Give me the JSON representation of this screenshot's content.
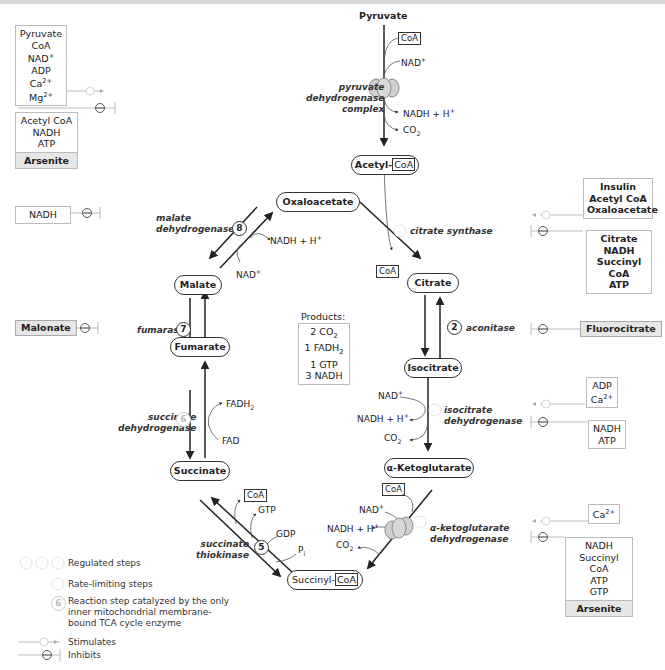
{
  "diagram": {
    "metabolites": {
      "pyruvate": "Pyruvate",
      "acetyl_coa_prefix": "Acetyl-",
      "coa": "CoA",
      "oxaloacetate": "Oxaloacetate",
      "citrate": "Citrate",
      "isocitrate": "Isocitrate",
      "alpha_ketoglutarate": "α-Ketoglutarate",
      "succinyl_coa_prefix": "Succinyl-",
      "succinate": "Succinate",
      "fumarate": "Fumarate",
      "malate": "Malate"
    },
    "enzymes": {
      "pdh": [
        "pyruvate",
        "dehydrogenase",
        "complex"
      ],
      "citrate_synthase": "citrate synthase",
      "aconitase": "aconitase",
      "isocitrate_dh": [
        "isocitrate",
        "dehydrogenase"
      ],
      "akg_dh": [
        "α-ketoglutarate",
        "dehydrogenase"
      ],
      "succinate_thiokinase": [
        "succinate",
        "thiokinase"
      ],
      "succinate_dh": [
        "succinate",
        "dehydrogenase"
      ],
      "fumarase": "fumarase",
      "malate_dh": [
        "malate",
        "dehydrogenase"
      ]
    },
    "step_numbers": {
      "s1": "1",
      "s2": "2",
      "s3": "3",
      "s4": "4",
      "s5": "5",
      "s6": "6",
      "s7": "7",
      "s8": "8"
    },
    "cofactors": {
      "coa": "CoA",
      "nad": "NAD+",
      "nadh": "NADH + H+",
      "co2": "CO2",
      "fad": "FAD",
      "fadh2": "FADH2",
      "gtp": "GTP",
      "gdp": "GDP",
      "pi": "Pi"
    },
    "products": {
      "title": "Products:",
      "items": [
        "2 CO2",
        "1 FADH2",
        "1 GTP",
        "3 NADH"
      ]
    },
    "regulators": {
      "pdh_stimulators": [
        "Pyruvate",
        "CoA",
        "NAD+",
        "ADP",
        "Ca2+",
        "Mg2+"
      ],
      "pdh_inhibitors": [
        "Acetyl CoA",
        "NADH",
        "ATP"
      ],
      "pdh_toxin": "Arsenite",
      "malate_dh_inhibitor": "NADH",
      "succinate_dh_inhibitor": "Malonate",
      "citrate_synthase_stimulators": [
        "Insulin",
        "Acetyl CoA",
        "Oxaloacetate"
      ],
      "citrate_synthase_inhibitors": [
        "Citrate",
        "NADH",
        "Succinyl CoA",
        "ATP"
      ],
      "aconitase_inhibitor": "Fluorocitrate",
      "isocitrate_dh_stimulators": [
        "ADP",
        "Ca2+"
      ],
      "isocitrate_dh_inhibitors": [
        "NADH",
        "ATP"
      ],
      "akg_dh_stimulators": [
        "Ca2+"
      ],
      "akg_dh_inhibitors": [
        "NADH",
        "Succinyl CoA",
        "ATP",
        "GTP"
      ],
      "akg_dh_toxin": "Arsenite"
    },
    "legend": {
      "regulated": "Regulated steps",
      "rate_limiting": "Rate-limiting steps",
      "membrane": [
        "Reaction step catalyzed by the only",
        "inner mitochondrial membrane-",
        "bound TCA cycle enzyme"
      ],
      "stimulates": "Stimulates",
      "inhibits": "Inhibits"
    },
    "colors": {
      "line": "#333333",
      "regulator_line": "#999999",
      "toxin_bg": "#e6e6e6",
      "enzyme_complex": "#cfcfcf"
    }
  }
}
